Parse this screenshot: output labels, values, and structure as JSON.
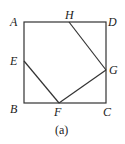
{
  "diagram": {
    "caption": "(a)",
    "points": {
      "A": {
        "label": "A",
        "x": 24,
        "y": 22
      },
      "D": {
        "label": "D",
        "x": 106,
        "y": 22
      },
      "B": {
        "label": "B",
        "x": 24,
        "y": 103
      },
      "C": {
        "label": "C",
        "x": 106,
        "y": 103
      },
      "H": {
        "label": "H",
        "x": 69,
        "y": 22
      },
      "E": {
        "label": "E",
        "x": 24,
        "y": 61
      },
      "F": {
        "label": "F",
        "x": 59,
        "y": 103
      },
      "G": {
        "label": "G",
        "x": 106,
        "y": 70
      }
    },
    "segments": [
      "AB",
      "BC",
      "CD",
      "DA",
      "HG",
      "GF",
      "FE"
    ],
    "line_color": "#333333"
  }
}
